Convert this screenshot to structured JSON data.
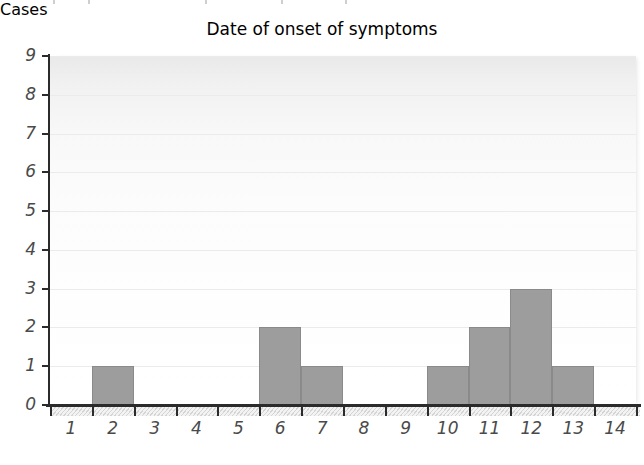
{
  "chart_data": {
    "type": "bar",
    "title": "",
    "xlabel": "Date of onset of symptoms",
    "ylabel": "Cases",
    "categories": [
      "1",
      "2",
      "3",
      "4",
      "5",
      "6",
      "7",
      "8",
      "9",
      "10",
      "11",
      "12",
      "13",
      "14"
    ],
    "values": [
      0,
      1,
      0,
      0,
      0,
      2,
      1,
      0,
      0,
      1,
      2,
      3,
      1,
      0
    ],
    "ylim": [
      0,
      9
    ],
    "yticks": [
      "0",
      "1",
      "2",
      "3",
      "4",
      "5",
      "6",
      "7",
      "8",
      "9"
    ],
    "xticks": [
      "1",
      "2",
      "3",
      "4",
      "5",
      "6",
      "7",
      "8",
      "9",
      "10",
      "11",
      "12",
      "13",
      "14"
    ],
    "grid": true,
    "legend": null,
    "colors": {
      "bar_fill": "#9d9d9d",
      "bar_stroke": "#8a8a8a",
      "axis": "#2b2b2b",
      "gridline": "#ebebeb",
      "tick_label": "#4a4a4a",
      "axis_title": "#6e6e6e",
      "plot_background": "#fbfbfb"
    }
  }
}
